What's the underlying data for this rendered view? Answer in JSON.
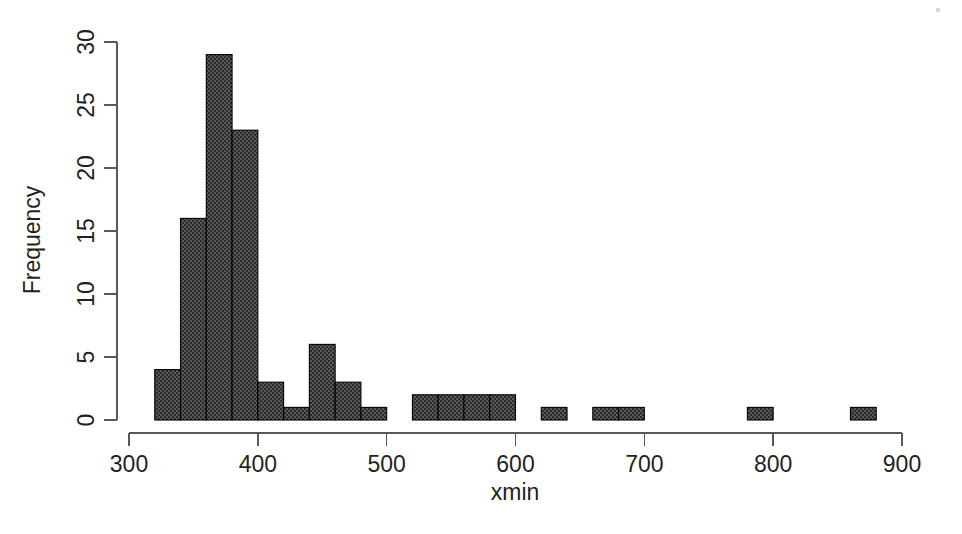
{
  "chart_data": {
    "type": "bar",
    "title": "",
    "subtitle": "",
    "xlabel": "xmin",
    "ylabel": "Frequency",
    "xlim": [
      300,
      900
    ],
    "ylim": [
      0,
      30
    ],
    "grid": false,
    "legend": null,
    "bin_width": 20,
    "x_ticks": [
      300,
      400,
      500,
      600,
      700,
      800,
      900
    ],
    "x_tick_labels": [
      "300",
      "400",
      "500",
      "600",
      "700",
      "800",
      "900"
    ],
    "y_ticks": [
      0,
      5,
      10,
      15,
      20,
      25,
      30
    ],
    "y_tick_labels": [
      "0",
      "5",
      "10",
      "15",
      "20",
      "25",
      "30"
    ],
    "bin_edges": [
      320,
      340,
      360,
      380,
      400,
      420,
      440,
      460,
      480,
      500,
      520,
      540,
      560,
      580,
      600,
      620,
      640,
      660,
      680,
      700,
      720,
      740,
      760,
      780,
      800,
      820,
      840,
      860,
      880
    ],
    "categories": [
      "320-340",
      "340-360",
      "360-380",
      "380-400",
      "400-420",
      "420-440",
      "440-460",
      "460-480",
      "480-500",
      "500-520",
      "520-540",
      "540-560",
      "560-580",
      "580-600",
      "600-620",
      "620-640",
      "640-660",
      "660-680",
      "680-700",
      "700-720",
      "720-740",
      "740-760",
      "760-780",
      "780-800",
      "800-820",
      "820-840",
      "840-860",
      "860-880"
    ],
    "values": [
      4,
      16,
      29,
      23,
      3,
      1,
      6,
      3,
      1,
      0,
      2,
      2,
      2,
      2,
      0,
      1,
      0,
      1,
      1,
      0,
      0,
      0,
      0,
      1,
      0,
      0,
      0,
      1
    ],
    "bar_fill": "#4d4d4d",
    "bar_edge": "#000000",
    "axis_color": "#58585a"
  }
}
